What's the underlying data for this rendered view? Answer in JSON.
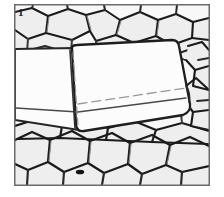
{
  "figure": {
    "panel_label": "1",
    "caption_visible": "",
    "frame": {
      "x": 14,
      "y": 4,
      "width": 196,
      "height": 182,
      "border_color": "#6b6b6b",
      "border_width": 1.5,
      "background_color": "#fbfbfb"
    },
    "palette": {
      "cell_wall_dark": "#1c1c1c",
      "cell_wall_mid": "#555555",
      "cell_wall_light": "#8d8d8d",
      "cell_fill": "#f1f1f1",
      "crystal_fill": "#ffffff",
      "crystal_edge": "#262626",
      "hidden_edge": "#9a9a9a",
      "page_background": "#ffffff"
    },
    "regions": [
      {
        "name": "upper-cell-band",
        "label": "upper honeycomb cells",
        "cell_shape": "hexagonal",
        "cell_count": 14,
        "relative_cell_size": "medium"
      },
      {
        "name": "central-crystal",
        "label": "embedded prismatic crystal",
        "cell_shape": "rounded-rectangular-prism",
        "cell_count": 2,
        "relative_cell_size": "large"
      },
      {
        "name": "lower-cell-band",
        "label": "lower polygonal cells",
        "cell_shape": "irregular-polygonal",
        "cell_count": 16,
        "relative_cell_size": "large"
      },
      {
        "name": "right-cell-column",
        "label": "right-edge cells",
        "cell_shape": "hexagonal",
        "cell_count": 7,
        "relative_cell_size": "medium"
      }
    ]
  }
}
